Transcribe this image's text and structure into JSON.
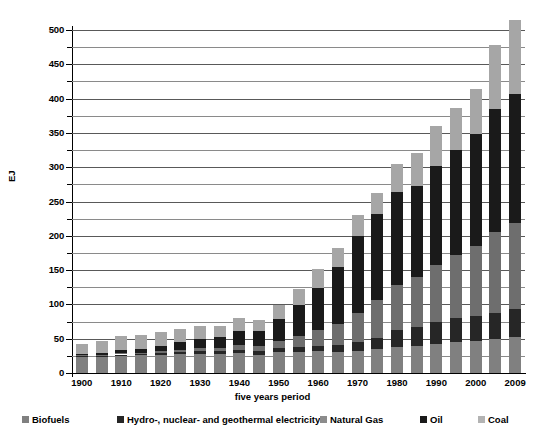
{
  "chart_data": {
    "type": "bar",
    "stacked": true,
    "title": "",
    "xlabel": "five years period",
    "ylabel": "EJ",
    "ylim": [
      0,
      525
    ],
    "ytick_major_step": 50,
    "ytick_minor_step": 25,
    "grid": true,
    "legend_position": "bottom",
    "ytick_labels": [
      "0",
      "50",
      "100",
      "150",
      "200",
      "250",
      "300",
      "350",
      "400",
      "450",
      "500"
    ],
    "ytick_values": [
      0,
      50,
      100,
      150,
      200,
      250,
      300,
      350,
      400,
      450,
      500
    ],
    "yminor_values": [
      25,
      75,
      125,
      175,
      225,
      275,
      325,
      375,
      425,
      475
    ],
    "categories": [
      "1900",
      "1905",
      "1910",
      "1915",
      "1920",
      "1925",
      "1930",
      "1935",
      "1940",
      "1945",
      "1950",
      "1955",
      "1960",
      "1965",
      "1970",
      "1975",
      "1980",
      "1985",
      "1990",
      "1995",
      "2000",
      "2005",
      "2009"
    ],
    "xtick_labels": [
      "1900",
      "1910",
      "1920",
      "1930",
      "1940",
      "1950",
      "1960",
      "1970",
      "1980",
      "1990",
      "2000",
      "2009"
    ],
    "xtick_categories": [
      "1900",
      "1910",
      "1920",
      "1930",
      "1940",
      "1950",
      "1960",
      "1970",
      "1980",
      "1990",
      "2000",
      "2009"
    ],
    "series": [
      {
        "name": "Biofuels",
        "color": "#808080",
        "values": [
          24,
          24,
          25,
          26,
          27,
          27,
          28,
          28,
          29,
          29,
          30,
          31,
          32,
          33,
          34,
          35,
          36,
          37,
          38,
          40,
          42,
          44,
          46
        ]
      },
      {
        "name": "Hydro-, nuclear- and geothermal electricity",
        "color": "#262626",
        "values": [
          1,
          1,
          2,
          2,
          3,
          3,
          4,
          4,
          5,
          5,
          6,
          7,
          8,
          10,
          13,
          17,
          22,
          26,
          29,
          31,
          33,
          34,
          35
        ]
      },
      {
        "name": "Natural Gas",
        "color": "#6e6e6e",
        "values": [
          1,
          1,
          2,
          2,
          3,
          4,
          5,
          5,
          7,
          8,
          11,
          16,
          23,
          33,
          45,
          56,
          62,
          68,
          75,
          82,
          92,
          104,
          110
        ]
      },
      {
        "name": "Oil",
        "color": "#1a1a1a",
        "values": [
          2,
          3,
          4,
          6,
          8,
          11,
          14,
          16,
          20,
          24,
          32,
          45,
          62,
          88,
          116,
          128,
          127,
          124,
          131,
          137,
          148,
          160,
          163
        ]
      },
      {
        "name": "Coal",
        "color": "#a6a6a6",
        "values": [
          15,
          18,
          21,
          20,
          21,
          19,
          18,
          16,
          19,
          18,
          20,
          23,
          27,
          30,
          32,
          30,
          38,
          46,
          53,
          55,
          59,
          82,
          95
        ]
      }
    ],
    "totals": [
      43,
      47,
      54,
      56,
      62,
      64,
      69,
      69,
      80,
      84,
      99,
      122,
      152,
      194,
      240,
      266,
      285,
      301,
      326,
      345,
      374,
      424,
      449
    ],
    "bar_tops_ej": [
      43,
      47,
      54,
      55,
      60,
      64,
      68,
      68,
      80,
      78,
      99,
      123,
      151,
      182,
      230,
      262,
      305,
      321,
      360,
      387,
      414,
      478,
      515
    ]
  },
  "legend": {
    "items": [
      {
        "label": "Biofuels",
        "color": "#808080"
      },
      {
        "label": "Hydro-, nuclear- and geothermal electricity",
        "color": "#262626"
      },
      {
        "label": "Natural Gas",
        "color": "#8c8c8c"
      },
      {
        "label": "Oil",
        "color": "#1a1a1a"
      },
      {
        "label": "Coal",
        "color": "#b3b3b3"
      }
    ]
  }
}
